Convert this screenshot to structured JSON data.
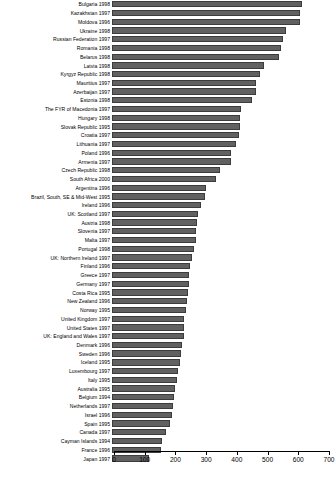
{
  "chart_data": {
    "type": "bar",
    "orientation": "horizontal",
    "title": "",
    "subtitle": "",
    "xlabel": "",
    "ylabel": "",
    "xlim": [
      0,
      700
    ],
    "xticks": [
      0,
      100,
      200,
      300,
      400,
      500,
      600,
      700
    ],
    "xtick_labels": [
      "0",
      "100",
      "200",
      "300",
      "400",
      "500",
      "600",
      "700"
    ],
    "grid": false,
    "legend": null,
    "bar_color": "#616161",
    "bar_edge_color": "#3c3c3c",
    "axis_color": "#000000",
    "background_color": "#ffffff",
    "categories": [
      "Bulgaria 1998",
      "Kazakhstan 1997",
      "Moldova 1996",
      "Ukraine 1998",
      "Russian Federation 1997",
      "Romania 1998",
      "Belarus 1998",
      "Latvia 1998",
      "Kyrgyz Republic 1998",
      "Mauritius 1997",
      "Azerbaijan 1997",
      "Estonia 1998",
      "The FYR of Macedonia 1997",
      "Hungary 1998",
      "Slovak Republic 1995",
      "Croatia 1997",
      "Lithuania 1997",
      "Poland 1996",
      "Armenia 1997",
      "Czech Republic 1998",
      "South Africa 2000",
      "Argentina 1996",
      "Brazil, South, SE & Mid-West 1995",
      "Ireland 1996",
      "UK: Scotland 1997",
      "Austria 1998",
      "Slovenia 1997",
      "Malta 1997",
      "Portugal 1998",
      "UK: Northern Ireland 1997",
      "Finland 1996",
      "Greece 1997",
      "Germany 1997",
      "Costa Rica 1995",
      "New Zealand 1996",
      "Norway 1995",
      "United Kingdom 1997",
      "United States 1997",
      "UK: England and Wales 1997",
      "Denmark 1996",
      "Sweden 1996",
      "Iceland 1995",
      "Luxembourg 1997",
      "Italy 1995",
      "Australia 1995",
      "Belgium 1994",
      "Netherlands 1997",
      "Israel 1996",
      "Spain 1995",
      "Canada 1997",
      "Cayman Islands 1994",
      "France 1996",
      "Japan 1997"
    ],
    "values": [
      620,
      613,
      612,
      568,
      558,
      549,
      545,
      495,
      483,
      470,
      468,
      457,
      420,
      418,
      416,
      412,
      404,
      389,
      388,
      350,
      337,
      306,
      302,
      289,
      281,
      276,
      272,
      272,
      266,
      260,
      254,
      252,
      250,
      247,
      245,
      240,
      236,
      234,
      233,
      229,
      226,
      222,
      215,
      210,
      206,
      203,
      198,
      195,
      190,
      176,
      164,
      160,
      122
    ]
  }
}
